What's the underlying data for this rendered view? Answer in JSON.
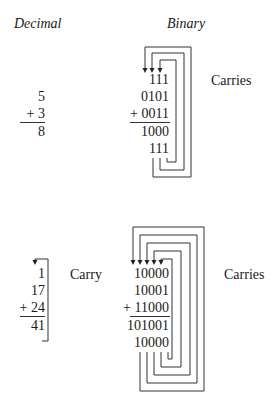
{
  "headers": {
    "decimal": "Decimal",
    "binary": "Binary"
  },
  "example1": {
    "decimal": {
      "addend1": "5",
      "addend2": "+ 3",
      "sum": "8"
    },
    "binary": {
      "carries_row": "111",
      "addend1": "0101",
      "addend2": "+ 0011",
      "sum": "1000",
      "carry_out_row": "111",
      "label": "Carries"
    }
  },
  "example2": {
    "decimal": {
      "carry_row": "1",
      "addend1": "17",
      "addend2": "+ 24",
      "sum": "41",
      "label": "Carry"
    },
    "binary": {
      "carries_row": "10000",
      "addend1": "10001",
      "addend2": "+ 11000",
      "sum": "101001",
      "carry_out_row": "10000",
      "label": "Carries"
    }
  }
}
